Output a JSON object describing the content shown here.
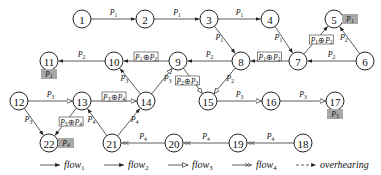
{
  "nodes": [
    {
      "id": "1",
      "label": "1",
      "x": 82,
      "y": 19
    },
    {
      "id": "2",
      "label": "2",
      "x": 145,
      "y": 19
    },
    {
      "id": "3",
      "label": "3",
      "x": 209,
      "y": 19
    },
    {
      "id": "4",
      "label": "4",
      "x": 270,
      "y": 19
    },
    {
      "id": "5",
      "label": "5",
      "x": 334,
      "y": 19
    },
    {
      "id": "6",
      "label": "6",
      "x": 365,
      "y": 61
    },
    {
      "id": "7",
      "label": "7",
      "x": 298,
      "y": 61
    },
    {
      "id": "8",
      "label": "8",
      "x": 241,
      "y": 61
    },
    {
      "id": "9",
      "label": "9",
      "x": 178,
      "y": 61
    },
    {
      "id": "10",
      "label": "10",
      "x": 114,
      "y": 61
    },
    {
      "id": "11",
      "label": "11",
      "x": 49,
      "y": 61
    },
    {
      "id": "12",
      "label": "12",
      "x": 19,
      "y": 101
    },
    {
      "id": "13",
      "label": "13",
      "x": 82,
      "y": 101
    },
    {
      "id": "14",
      "label": "14",
      "x": 146,
      "y": 101
    },
    {
      "id": "15",
      "label": "15",
      "x": 208,
      "y": 101
    },
    {
      "id": "16",
      "label": "16",
      "x": 271,
      "y": 101
    },
    {
      "id": "17",
      "label": "17",
      "x": 335,
      "y": 101
    },
    {
      "id": "18",
      "label": "18",
      "x": 303,
      "y": 143
    },
    {
      "id": "19",
      "label": "19",
      "x": 238,
      "y": 143
    },
    {
      "id": "20",
      "label": "20",
      "x": 174,
      "y": 143
    },
    {
      "id": "21",
      "label": "21",
      "x": 112,
      "y": 143
    },
    {
      "id": "22",
      "label": "22",
      "x": 49,
      "y": 143
    }
  ],
  "edges": [
    {
      "from": "1",
      "to": "2",
      "label": "P1",
      "flow": "flow1"
    },
    {
      "from": "2",
      "to": "3",
      "label": "P1",
      "flow": "flow1"
    },
    {
      "from": "3",
      "to": "4",
      "label": "P1",
      "flow": "flow1"
    },
    {
      "from": "3",
      "to": "8",
      "label": "P1",
      "flow": "flow1"
    },
    {
      "from": "4",
      "to": "7",
      "label": "P1",
      "flow": "flow1"
    },
    {
      "from": "7",
      "to": "5",
      "label": "P1⊕P2",
      "boxed": true,
      "flow": "flow1"
    },
    {
      "from": "6",
      "to": "5",
      "label": "P2",
      "flow": "flow2"
    },
    {
      "from": "6",
      "to": "7",
      "label": "P2",
      "flow": "flow2"
    },
    {
      "from": "7",
      "to": "8",
      "label": "P1⊕P2",
      "boxed": true,
      "flow": "flow2"
    },
    {
      "from": "8",
      "to": "9",
      "label": "P2",
      "flow": "flow2"
    },
    {
      "from": "8",
      "to": "15",
      "label": "P2",
      "flow": "flow3"
    },
    {
      "from": "9",
      "to": "10",
      "label": "P1⊕P2",
      "boxed": true,
      "flow": "flow2"
    },
    {
      "from": "9",
      "to": "15",
      "label": "P2⊕P3",
      "boxed": true,
      "flow": "flow3"
    },
    {
      "from": "10",
      "to": "11",
      "label": "P2",
      "flow": "flow2"
    },
    {
      "from": "14",
      "to": "10",
      "label": "P3",
      "flow": "flow2"
    },
    {
      "from": "14",
      "to": "9",
      "label": "P3",
      "flow": "flow3"
    },
    {
      "from": "15",
      "to": "16",
      "label": "P3",
      "flow": "flow3"
    },
    {
      "from": "16",
      "to": "17",
      "label": "P3",
      "flow": "flow3"
    },
    {
      "from": "12",
      "to": "13",
      "label": "P3",
      "flow": "flow3"
    },
    {
      "from": "12",
      "to": "22",
      "label": "P3",
      "flow": "flow1"
    },
    {
      "from": "13",
      "to": "14",
      "label": "P3⊕P4",
      "boxed": true,
      "flow": "flow3"
    },
    {
      "from": "13",
      "to": "22",
      "label": "P3⊕P4",
      "boxed": true,
      "flow": "flow2"
    },
    {
      "from": "21",
      "to": "13",
      "label": "P4",
      "flow": "flow2"
    },
    {
      "from": "21",
      "to": "14",
      "label": "P4",
      "flow": "flow2"
    },
    {
      "from": "20",
      "to": "21",
      "label": "P4",
      "flow": "flow4"
    },
    {
      "from": "19",
      "to": "20",
      "label": "P4",
      "flow": "flow4"
    },
    {
      "from": "18",
      "to": "19",
      "label": "P4",
      "flow": "flow4"
    }
  ],
  "decoded_tags": [
    {
      "node": "5",
      "label": "P1"
    },
    {
      "node": "11",
      "label": "P1"
    },
    {
      "node": "17",
      "label": "P3"
    },
    {
      "node": "22",
      "label": "P4"
    }
  ],
  "legend": [
    {
      "key": "flow1",
      "label": "flow",
      "sub": "1",
      "style": "solid-filled-arrow"
    },
    {
      "key": "flow2",
      "label": "flow",
      "sub": "2",
      "style": "solid-filled-arrow"
    },
    {
      "key": "flow3",
      "label": "flow",
      "sub": "3",
      "style": "open-triangle-arrow"
    },
    {
      "key": "flow4",
      "label": "flow",
      "sub": "4",
      "style": "double-arrow"
    },
    {
      "key": "overhearing",
      "label": "overhearing",
      "sub": "",
      "style": "dashed-arrow"
    }
  ]
}
